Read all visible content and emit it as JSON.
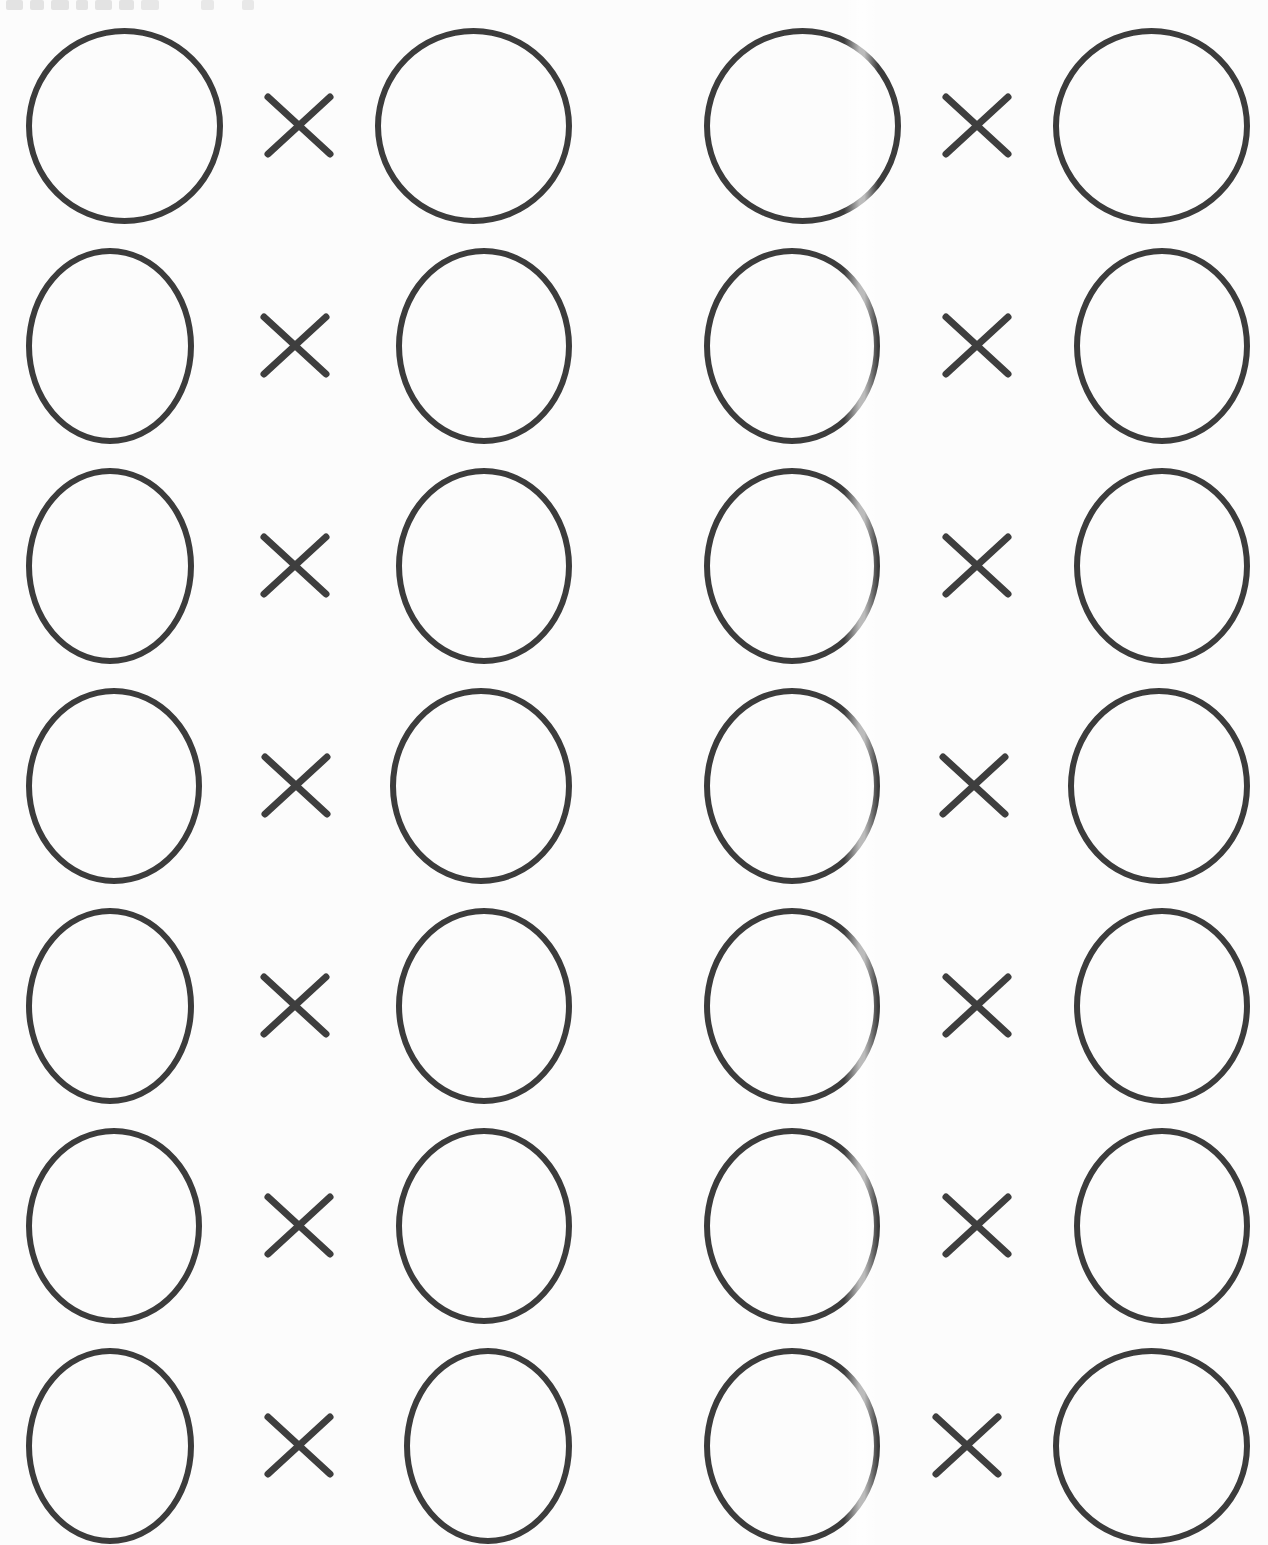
{
  "document": {
    "type": "worksheet-scan",
    "operator": "×",
    "operator_name": "multiplication-sign",
    "grid": {
      "rows": 7,
      "columns": 2,
      "problem_count": 14
    },
    "problems": [
      {
        "row": 1,
        "column": "left",
        "left_value": "",
        "operator": "×",
        "right_value": ""
      },
      {
        "row": 1,
        "column": "right",
        "left_value": "",
        "operator": "×",
        "right_value": ""
      },
      {
        "row": 2,
        "column": "left",
        "left_value": "",
        "operator": "×",
        "right_value": ""
      },
      {
        "row": 2,
        "column": "right",
        "left_value": "",
        "operator": "×",
        "right_value": ""
      },
      {
        "row": 3,
        "column": "left",
        "left_value": "",
        "operator": "×",
        "right_value": ""
      },
      {
        "row": 3,
        "column": "right",
        "left_value": "",
        "operator": "×",
        "right_value": ""
      },
      {
        "row": 4,
        "column": "left",
        "left_value": "",
        "operator": "×",
        "right_value": ""
      },
      {
        "row": 4,
        "column": "right",
        "left_value": "",
        "operator": "×",
        "right_value": ""
      },
      {
        "row": 5,
        "column": "left",
        "left_value": "",
        "operator": "×",
        "right_value": ""
      },
      {
        "row": 5,
        "column": "right",
        "left_value": "",
        "operator": "×",
        "right_value": ""
      },
      {
        "row": 6,
        "column": "left",
        "left_value": "",
        "operator": "×",
        "right_value": ""
      },
      {
        "row": 6,
        "column": "right",
        "left_value": "",
        "operator": "×",
        "right_value": ""
      },
      {
        "row": 7,
        "column": "left",
        "left_value": "",
        "operator": "×",
        "right_value": ""
      },
      {
        "row": 7,
        "column": "right",
        "left_value": "",
        "operator": "×",
        "right_value": ""
      }
    ]
  },
  "colors": {
    "ink": "#3c3c3c",
    "paper": "#fcfcfc",
    "artifact_gray": "#cfcfcf"
  },
  "artifacts": {
    "top_edge_clipped_text_illegible": true,
    "vertical_scan_streak_right_column": true
  }
}
